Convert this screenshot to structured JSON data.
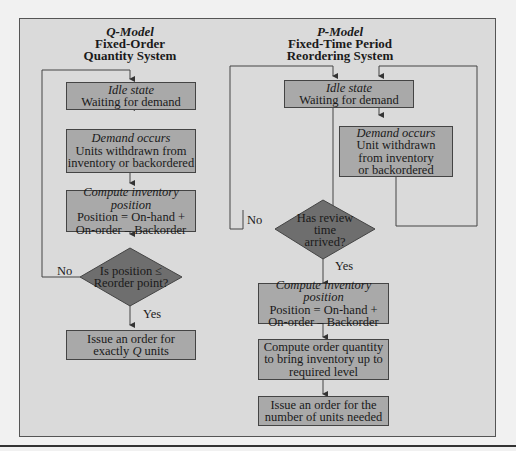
{
  "q_model": {
    "title_italic": "Q-Model",
    "title_line1": "Fixed-Order",
    "title_line2": "Quantity System",
    "idle": {
      "head": "Idle state",
      "line1": "Waiting for demand"
    },
    "demand": {
      "head": "Demand occurs",
      "line1": "Units withdrawn from",
      "line2": "inventory or backordered"
    },
    "compute": {
      "head": "Compute inventory position",
      "line1": "Position = On-hand +",
      "line2": "On-order – Backorder"
    },
    "decision": {
      "line1": "Is position ≤",
      "line2": "Reorder point?"
    },
    "no_label": "No",
    "yes_label": "Yes",
    "issue": {
      "line1": "Issue an order for",
      "line2_pre": "exactly ",
      "line2_q": "Q",
      "line2_post": " units"
    }
  },
  "p_model": {
    "title_italic": "P-Model",
    "title_line1": "Fixed-Time Period",
    "title_line2": "Reordering System",
    "idle": {
      "head": "Idle state",
      "line1": "Waiting for demand"
    },
    "demand": {
      "head": "Demand occurs",
      "line1": "Unit withdrawn",
      "line2": "from inventory",
      "line3": "or backordered"
    },
    "decision": {
      "line1": "Has review",
      "line2": "time",
      "line3": "arrived?"
    },
    "no_label": "No",
    "yes_label": "Yes",
    "compute": {
      "head": "Compute inventory position",
      "line1": "Position = On-hand +",
      "line2": "On-order – Backorder"
    },
    "order_qty": {
      "line1": "Compute order quantity",
      "line2": "to bring inventory up to",
      "line3": "required level"
    },
    "issue": {
      "line1": "Issue an order for the",
      "line2": "number of units needed"
    }
  },
  "colors": {
    "page_bg": "#f1f1f1",
    "panel_bg": "#dadada",
    "box_fill": "#a9a9a9",
    "diamond_fill": "#6e6e6e",
    "line": "#444444"
  }
}
